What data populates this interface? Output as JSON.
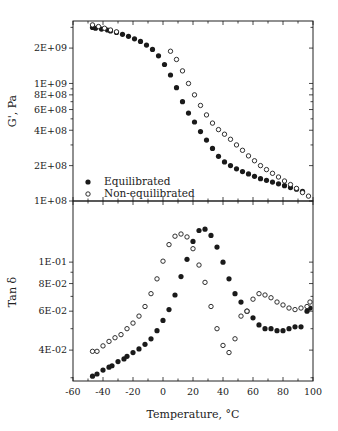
{
  "chart_data": [
    {
      "type": "scatter",
      "panel": "upper",
      "title": "",
      "xlabel": "Temperature, °C",
      "ylabel": "G', Pa",
      "yscale": "log",
      "xlim": [
        -60,
        100
      ],
      "ylim": [
        100000000.0,
        3400000000.0
      ],
      "x_ticks": [
        -60,
        -40,
        -20,
        0,
        20,
        40,
        60,
        80,
        100
      ],
      "y_tick_labels": [
        "2E+09",
        "1E+09",
        "8E+08",
        "6E+08",
        "4E+08",
        "2E+08",
        "1E+08"
      ],
      "y_tick_values": [
        2000000000.0,
        1000000000.0,
        800000000.0,
        600000000.0,
        400000000.0,
        200000000.0,
        100000000.0
      ],
      "grid": false,
      "legend": {
        "position": "lower-left",
        "entries": [
          "Equilibrated",
          "Non-equilibrated"
        ]
      },
      "series": [
        {
          "name": "Equilibrated",
          "marker": "filled-circle",
          "x": [
            -47,
            -45,
            -41,
            -37,
            -35,
            -31,
            -27,
            -23,
            -19,
            -15,
            -11,
            -7,
            -3,
            1,
            5,
            9,
            13,
            17,
            21,
            25,
            29,
            33,
            37,
            41,
            45,
            49,
            53,
            57,
            61,
            65,
            69,
            73,
            77,
            81,
            85,
            89,
            93
          ],
          "y": [
            3000000000.0,
            2950000000.0,
            2900000000.0,
            2850000000.0,
            2800000000.0,
            2720000000.0,
            2620000000.0,
            2520000000.0,
            2400000000.0,
            2280000000.0,
            2120000000.0,
            1950000000.0,
            1720000000.0,
            1450000000.0,
            1180000000.0,
            920000000.0,
            700000000.0,
            560000000.0,
            470000000.0,
            390000000.0,
            330000000.0,
            280000000.0,
            240000000.0,
            215000000.0,
            200000000.0,
            188000000.0,
            178000000.0,
            170000000.0,
            162000000.0,
            155000000.0,
            150000000.0,
            145000000.0,
            140000000.0,
            135000000.0,
            130000000.0,
            126000000.0,
            121000000.0
          ]
        },
        {
          "name": "Non-equilibrated",
          "marker": "open-circle",
          "x": [
            -47,
            -43,
            -39,
            -35,
            -31,
            5,
            9,
            13,
            17,
            21,
            25,
            29,
            33,
            37,
            41,
            45,
            49,
            53,
            57,
            61,
            65,
            69,
            73,
            77,
            81,
            85,
            89,
            93,
            97
          ],
          "y": [
            3150000000.0,
            3050000000.0,
            2950000000.0,
            2850000000.0,
            2750000000.0,
            1880000000.0,
            1600000000.0,
            1280000000.0,
            1000000000.0,
            800000000.0,
            650000000.0,
            540000000.0,
            460000000.0,
            405000000.0,
            370000000.0,
            335000000.0,
            300000000.0,
            270000000.0,
            242000000.0,
            220000000.0,
            200000000.0,
            185000000.0,
            172000000.0,
            160000000.0,
            148000000.0,
            138000000.0,
            128000000.0,
            118000000.0,
            110000000.0
          ]
        }
      ]
    },
    {
      "type": "scatter",
      "panel": "lower",
      "title": "",
      "xlabel": "Temperature, °C",
      "ylabel": "Tan δ",
      "yscale": "log",
      "xlim": [
        -60,
        100
      ],
      "ylim": [
        0.029,
        0.189
      ],
      "x_ticks": [
        -60,
        -40,
        -20,
        0,
        20,
        40,
        60,
        80,
        100
      ],
      "y_tick_labels": [
        "1E-01",
        "8E-02",
        "6E-02",
        "4E-02"
      ],
      "y_tick_values": [
        0.1,
        0.08,
        0.06,
        0.04
      ],
      "grid": false,
      "series": [
        {
          "name": "Equilibrated",
          "marker": "filled-circle",
          "x": [
            -47,
            -44,
            -40,
            -36,
            -34,
            -30,
            -26,
            -24,
            -20,
            -16,
            -12,
            -8,
            -4,
            0,
            4,
            8,
            12,
            16,
            20,
            24,
            28,
            32,
            36,
            40,
            44,
            48,
            52,
            56,
            60,
            64,
            68,
            72,
            76,
            80,
            84,
            88,
            92,
            96,
            98
          ],
          "y": [
            0.0305,
            0.0312,
            0.0325,
            0.0335,
            0.034,
            0.0355,
            0.0365,
            0.0375,
            0.039,
            0.0405,
            0.0425,
            0.045,
            0.049,
            0.0545,
            0.061,
            0.071,
            0.086,
            0.103,
            0.124,
            0.139,
            0.141,
            0.132,
            0.117,
            0.1,
            0.084,
            0.072,
            0.066,
            0.06,
            0.056,
            0.052,
            0.05,
            0.05,
            0.049,
            0.049,
            0.05,
            0.051,
            0.051,
            0.06,
            0.062
          ]
        },
        {
          "name": "Non-equilibrated",
          "marker": "open-circle",
          "x": [
            -47,
            -44,
            -40,
            -36,
            -32,
            -28,
            -24,
            -20,
            -16,
            -12,
            -8,
            -4,
            0,
            4,
            8,
            12,
            16,
            20,
            24,
            28,
            32,
            36,
            40,
            44,
            48,
            52,
            56,
            60,
            64,
            68,
            72,
            76,
            80,
            84,
            88,
            92,
            96,
            98
          ],
          "y": [
            0.0395,
            0.0395,
            0.0418,
            0.0438,
            0.0455,
            0.047,
            0.05,
            0.053,
            0.057,
            0.063,
            0.072,
            0.084,
            0.101,
            0.12,
            0.131,
            0.134,
            0.13,
            0.115,
            0.097,
            0.081,
            0.063,
            0.05,
            0.042,
            0.039,
            0.045,
            0.057,
            0.06,
            0.068,
            0.072,
            0.071,
            0.069,
            0.066,
            0.064,
            0.062,
            0.061,
            0.062,
            0.063,
            0.066
          ]
        }
      ]
    }
  ],
  "axes": {
    "x_label": "Temperature, °C",
    "x_tick_labels": [
      "-60",
      "-40",
      "-20",
      "0",
      "20",
      "40",
      "60",
      "80",
      "100"
    ],
    "upper_y_label": "G', Pa",
    "lower_y_label": "Tan δ",
    "upper_y_tick_labels": [
      "2E+09",
      "1E+09",
      "8E+08",
      "6E+08",
      "4E+08",
      "2E+08",
      "1E+08"
    ],
    "lower_y_tick_labels": [
      "1E-01",
      "8E-02",
      "6E-02",
      "4E-02"
    ]
  },
  "legend": {
    "filled_label": "Equilibrated",
    "open_label": "Non-equilibrated"
  },
  "colors": {
    "ink": "#1a1a1a",
    "background": "#ffffff"
  }
}
